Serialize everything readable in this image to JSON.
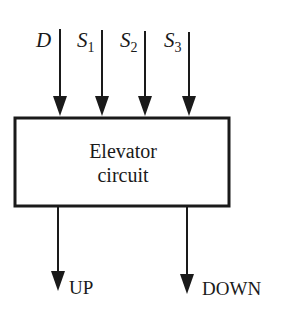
{
  "diagram": {
    "type": "block-diagram",
    "block": {
      "line1": "Elevator",
      "line2": "circuit"
    },
    "inputs": [
      {
        "name": "D",
        "sub": ""
      },
      {
        "name": "S",
        "sub": "1"
      },
      {
        "name": "S",
        "sub": "2"
      },
      {
        "name": "S",
        "sub": "3"
      }
    ],
    "outputs": [
      {
        "name": "UP"
      },
      {
        "name": "DOWN"
      }
    ],
    "colors": {
      "stroke": "#1a1a1a",
      "background": "#ffffff"
    }
  }
}
